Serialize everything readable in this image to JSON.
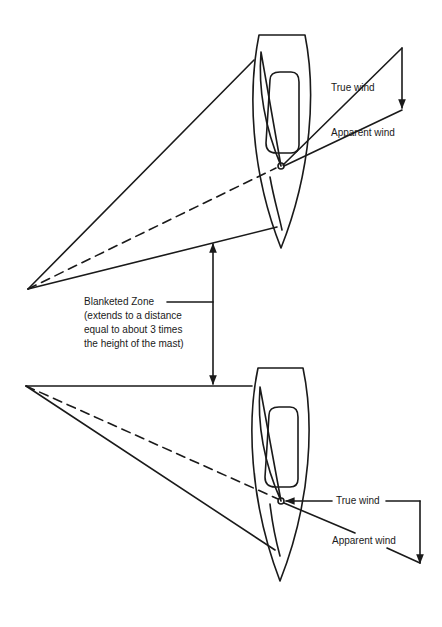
{
  "diagram": {
    "ink_color": "#1a1a1a",
    "background": "#ffffff",
    "top_boat": {
      "true_wind_label": "True wind",
      "apparent_wind_label": "Apparent wind"
    },
    "bottom_boat": {
      "true_wind_label": "True wind",
      "apparent_wind_label": "Apparent wind"
    },
    "blanketed_zone": {
      "label": "Blanketed Zone",
      "note_line1": "(extends to a distance",
      "note_line2": "equal to about 3 times",
      "note_line3": "the height of the mast)"
    }
  }
}
